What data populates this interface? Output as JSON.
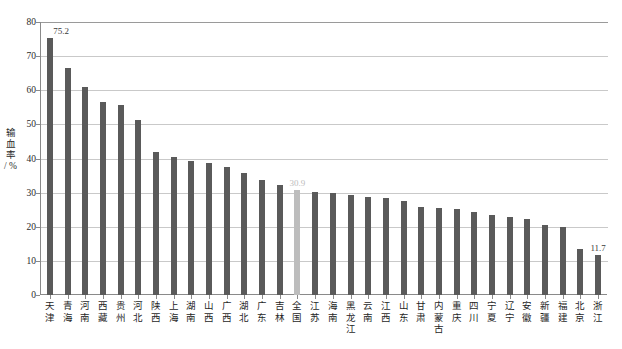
{
  "chart_data": {
    "type": "bar",
    "title": "",
    "xlabel": "",
    "ylabel": "输血率 / %",
    "ylim": [
      0,
      80
    ],
    "yticks": [
      0,
      10,
      20,
      30,
      40,
      50,
      60,
      70,
      80
    ],
    "grid": true,
    "legend": "none",
    "highlight_category": "全国",
    "colors": {
      "bar": "#5a5a5a",
      "highlight_bar": "#bdbdbd",
      "gridline": "#c9c9c9",
      "axis": "#8a8a8a",
      "text": "#1f1f1f",
      "value_label": "#3a3a3a",
      "highlight_value_label": "#bcbcbc",
      "background": "#ffffff"
    },
    "categories": [
      "天津",
      "青海",
      "河南",
      "西藏",
      "贵州",
      "河北",
      "陕西",
      "上海",
      "湖南",
      "山西",
      "广西",
      "湖北",
      "广东",
      "吉林",
      "全国",
      "江苏",
      "海南",
      "黑龙江",
      "云南",
      "江西",
      "山东",
      "甘肃",
      "内蒙古",
      "重庆",
      "四川",
      "宁夏",
      "辽宁",
      "安徽",
      "新疆",
      "福建",
      "北京",
      "浙江"
    ],
    "values": [
      75.2,
      66.6,
      61.0,
      56.6,
      55.8,
      51.4,
      41.8,
      40.5,
      39.2,
      38.8,
      37.4,
      35.8,
      33.6,
      32.2,
      30.9,
      30.2,
      29.8,
      29.4,
      28.6,
      28.4,
      27.6,
      25.8,
      25.4,
      25.2,
      24.2,
      23.4,
      23.0,
      22.2,
      20.4,
      20.0,
      13.4,
      11.7
    ],
    "value_labels": [
      {
        "category": "天津",
        "value": "75.2"
      },
      {
        "category": "全国",
        "value": "30.9"
      },
      {
        "category": "浙江",
        "value": "11.7"
      }
    ]
  }
}
